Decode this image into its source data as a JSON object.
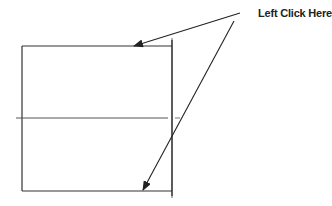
{
  "diagram": {
    "callout_label": "Left Click Here",
    "colors": {
      "background": "#ffffff",
      "stroke": "#333333",
      "text": "#222222"
    },
    "shapes": {
      "rectangle": {
        "x": 22,
        "y": 46,
        "width": 150,
        "height": 145
      },
      "vertical_line": {
        "x": 172,
        "y1": 40,
        "y2": 196
      },
      "horizontal_line": {
        "y": 118,
        "x1": 16,
        "x2": 180
      }
    },
    "arrows": [
      {
        "from": [
          240,
          13
        ],
        "to": [
          134,
          46
        ],
        "target": "top-edge"
      },
      {
        "from": [
          234,
          21
        ],
        "to": [
          143,
          190
        ],
        "target": "bottom-edge"
      }
    ]
  }
}
